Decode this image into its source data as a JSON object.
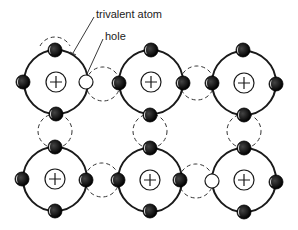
{
  "diagram": {
    "labels": {
      "trivalent_atom": "trivalent atom",
      "hole": "hole"
    },
    "colors": {
      "line": "#1a1a1a",
      "electron": "#111111",
      "background": "#ffffff"
    },
    "atoms": [
      {
        "id": "atom-r1c1",
        "cx": 56,
        "cy": 82,
        "type": "trivalent",
        "nucleus": "+"
      },
      {
        "id": "atom-r1c2",
        "cx": 151,
        "cy": 82,
        "type": "normal",
        "nucleus": "+"
      },
      {
        "id": "atom-r1c3",
        "cx": 244,
        "cy": 83,
        "type": "normal",
        "nucleus": "+"
      },
      {
        "id": "atom-r2c1",
        "cx": 55,
        "cy": 179,
        "type": "normal",
        "nucleus": "+"
      },
      {
        "id": "atom-r2c2",
        "cx": 150,
        "cy": 180,
        "type": "normal",
        "nucleus": "+"
      },
      {
        "id": "atom-r2c3",
        "cx": 244,
        "cy": 180,
        "type": "trivalent",
        "nucleus": "+"
      }
    ],
    "holes": [
      {
        "atom": "atom-r1c1",
        "position": "right"
      },
      {
        "atom": "atom-r2c3",
        "position": "left"
      }
    ],
    "covalent_bonds": "dashed circles between neighbouring atoms"
  }
}
